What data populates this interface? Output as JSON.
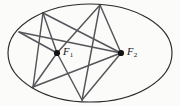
{
  "figure": {
    "background_color": "#fbfbfa",
    "curve_color": "#2a2a2a",
    "chord_color": "#55555a",
    "focus_color": "#141414"
  },
  "ellipse": {
    "center_x": 90,
    "center_y": 53,
    "radius_x": 82,
    "radius_y": 49,
    "stroke_width": 1.15
  },
  "foci": [
    {
      "name": "F1",
      "label": "F",
      "subscript": "1",
      "x": 57,
      "y": 53
    },
    {
      "name": "F2",
      "label": "F",
      "subscript": "2",
      "x": 121,
      "y": 53
    }
  ],
  "boundary_points": [
    {
      "name": "P1",
      "x": 43,
      "y": 13,
      "position": "upper-left"
    },
    {
      "name": "P2",
      "x": 100,
      "y": 5,
      "position": "top"
    },
    {
      "name": "P3",
      "x": 19,
      "y": 32,
      "position": "left"
    },
    {
      "name": "P4",
      "x": 33,
      "y": 87,
      "position": "lower-left"
    },
    {
      "name": "P5",
      "x": 82,
      "y": 100,
      "position": "bottom"
    }
  ],
  "chords": [
    {
      "name": "chord-p1-f1",
      "x1": 43,
      "y1": 13,
      "x2": 57,
      "y2": 53
    },
    {
      "name": "chord-p1-f2",
      "x1": 43,
      "y1": 13,
      "x2": 121,
      "y2": 53
    },
    {
      "name": "chord-p2-f1",
      "x1": 100,
      "y1": 5,
      "x2": 57,
      "y2": 53
    },
    {
      "name": "chord-p2-f2",
      "x1": 100,
      "y1": 5,
      "x2": 121,
      "y2": 53
    },
    {
      "name": "chord-p3-f1",
      "x1": 19,
      "y1": 32,
      "x2": 57,
      "y2": 53
    },
    {
      "name": "chord-p3-f2",
      "x1": 19,
      "y1": 32,
      "x2": 121,
      "y2": 53
    },
    {
      "name": "chord-p4-f1",
      "x1": 33,
      "y1": 87,
      "x2": 57,
      "y2": 53
    },
    {
      "name": "chord-p4-f2",
      "x1": 33,
      "y1": 87,
      "x2": 121,
      "y2": 53
    },
    {
      "name": "chord-p5-f1",
      "x1": 82,
      "y1": 100,
      "x2": 57,
      "y2": 53
    },
    {
      "name": "chord-p5-f2",
      "x1": 82,
      "y1": 100,
      "x2": 121,
      "y2": 53
    },
    {
      "name": "chord-p1-p4",
      "x1": 43,
      "y1": 13,
      "x2": 33,
      "y2": 87
    },
    {
      "name": "chord-p2-p5",
      "x1": 100,
      "y1": 5,
      "x2": 82,
      "y2": 100
    }
  ]
}
